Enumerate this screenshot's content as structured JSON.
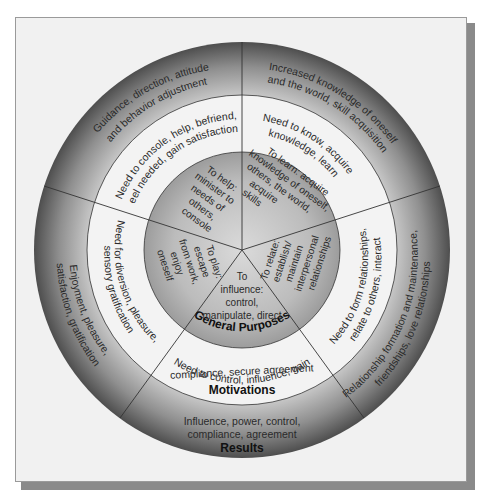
{
  "diagram": {
    "type": "concentric-wheel",
    "center": [
      242,
      250
    ],
    "radii": {
      "outer": 208,
      "middle": 155,
      "inner": 98
    },
    "colors": {
      "outer_dark": "#4e4e4e",
      "outer_light": "#c4c4c4",
      "middle": "#f3f3f3",
      "inner_dark": "#9c9c9c",
      "inner_light": "#d4d4d4",
      "lines": "#333333",
      "frame_bg": "#f1f1f1",
      "shadow": "#8a8a8a"
    },
    "ring_labels": {
      "inner": "General Purposes",
      "middle": "Motivations",
      "outer": "Results"
    },
    "segments": [
      {
        "id": "help",
        "general_purpose": [
          "To help:",
          "minister to",
          "needs of",
          "others,",
          "console"
        ],
        "motivation": [
          "Need to console, help, befriend,",
          "feel needed, gain satisfaction"
        ],
        "result": [
          "Guidance, direction, attitude",
          "and behavior adjustment"
        ]
      },
      {
        "id": "learn",
        "general_purpose": [
          "To learn: acquire",
          "knowledge of oneself,",
          "others, the world,",
          "acquire",
          "skills"
        ],
        "motivation": [
          "Need to know, acquire",
          "knowledge, learn"
        ],
        "result": [
          "Increased knowledge of oneself",
          "and the world, skill acquisition"
        ]
      },
      {
        "id": "relate",
        "general_purpose": [
          "To relate:",
          "establish/",
          "maintain",
          "interpersonal",
          "relationships"
        ],
        "motivation": [
          "Need to form relationships,",
          "relate to others, interact"
        ],
        "result": [
          "Relationship formation and maintenance,",
          "friendships, love relationships"
        ]
      },
      {
        "id": "influence",
        "general_purpose": [
          "To",
          "influence:",
          "control,",
          "manipulate, direct"
        ],
        "motivation": [
          "Need to control, influence, gain",
          "compliance, secure agreement"
        ],
        "result": [
          "Influence, power, control,",
          "compliance, agreement"
        ]
      },
      {
        "id": "play",
        "general_purpose": [
          "To play:",
          "escape",
          "from work,",
          "enjoy",
          "oneself"
        ],
        "motivation": [
          "Need for diversion, pleasure,",
          "sensory gratification"
        ],
        "result": [
          "Enjoyment, pleasure,",
          "satisfaction, gratification"
        ]
      }
    ]
  }
}
